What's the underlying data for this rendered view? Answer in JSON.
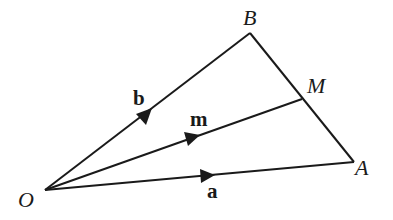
{
  "diagram": {
    "points": {
      "O": {
        "label": "O",
        "x": 45,
        "y": 190
      },
      "A": {
        "label": "A",
        "x": 354,
        "y": 162
      },
      "B": {
        "label": "B",
        "x": 250,
        "y": 33
      },
      "M": {
        "label": "M",
        "x": 302,
        "y": 99
      }
    },
    "vectors": [
      {
        "from": "O",
        "to": "B",
        "label": "b"
      },
      {
        "from": "O",
        "to": "M",
        "label": "m"
      },
      {
        "from": "O",
        "to": "A",
        "label": "a"
      }
    ],
    "segments": [
      {
        "from": "B",
        "to": "A"
      }
    ],
    "line_color": "#1a1a1a"
  }
}
